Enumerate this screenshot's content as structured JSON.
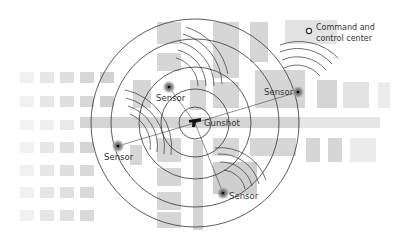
{
  "diagram": {
    "type": "gunshot-detection-triangulation",
    "gunshot": {
      "label": "Gunshot",
      "x": 195,
      "y": 123,
      "icon": "gun-icon"
    },
    "rings": [
      16,
      34,
      56,
      84,
      104
    ],
    "sensors": [
      {
        "label": "Sensor",
        "x": 169,
        "y": 87,
        "label_x": 156,
        "label_y": 101
      },
      {
        "label": "Sensor",
        "x": 118,
        "y": 146,
        "label_x": 104,
        "label_y": 160
      },
      {
        "label": "Sensor",
        "x": 298,
        "y": 92,
        "label_x": 264,
        "label_y": 95
      },
      {
        "label": "Sensor",
        "x": 223,
        "y": 193,
        "label_x": 229,
        "label_y": 198
      }
    ],
    "legend": {
      "line1": "Command and",
      "line2": "control center",
      "marker": "open-circle"
    },
    "colors": {
      "ring_stroke": "#333333",
      "block_fill": "#d6d6d6",
      "street_fill": "#cfcfcf",
      "sensor_halo": "#8a8a8a",
      "text": "#333333"
    }
  }
}
